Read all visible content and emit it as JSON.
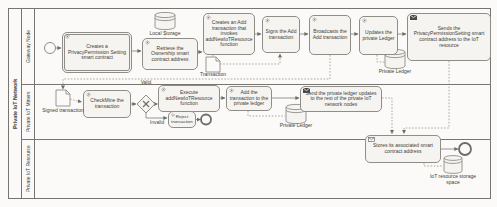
{
  "pool": {
    "label": "Private IoT Network"
  },
  "lanes": {
    "lane1": "Gateway Node",
    "lane2": "Private IoT Miners",
    "lane3": "Private IoT Resource"
  },
  "tasks": {
    "create_privacy": "Creates a PrivacyPermission Setting smart contract",
    "retrieve_ownership": "Retrieve the Ownership smart contract address",
    "create_add_tx": "Creates an Add transaction that invokes addNewIoTResource function",
    "sign_tx": "Signs the Add transaction",
    "broadcast_tx": "Broadcasts the Add transaction",
    "update_ledger": "Updates the private Ledger",
    "send_address": "Sends the PrivacyPermissionSetting smart contract address to the IoT resource",
    "checkmine": "CheckMine the transaction",
    "execute_fn": "Execute addNewIoTResource function",
    "add_tx_ledger": "Add the transaction to the private ledger",
    "send_updates": "Send the private ledger updates to the rest of the private IoT network nodes",
    "reject_tx": "Reject transaction",
    "store_address": "Stores its associated smart contract address"
  },
  "artifacts": {
    "local_storage": "Local Storage",
    "transaction": "Transaction",
    "private_ledger_1": "Private Ledger",
    "signed_transaction": "Signed transaction",
    "private_ledger_2": "Private Ledger",
    "iot_storage": "IoT resource storage space"
  },
  "flow_labels": {
    "valid": "Valid",
    "invalid": "Invalid"
  },
  "colors": {
    "task_fill": "#f5f4f1",
    "task_border": "#8f8d88",
    "line": "#7d7b76",
    "text": "#3f3e3a",
    "send_icon_fill": "#4a4946",
    "background": "#fbfaf8"
  }
}
